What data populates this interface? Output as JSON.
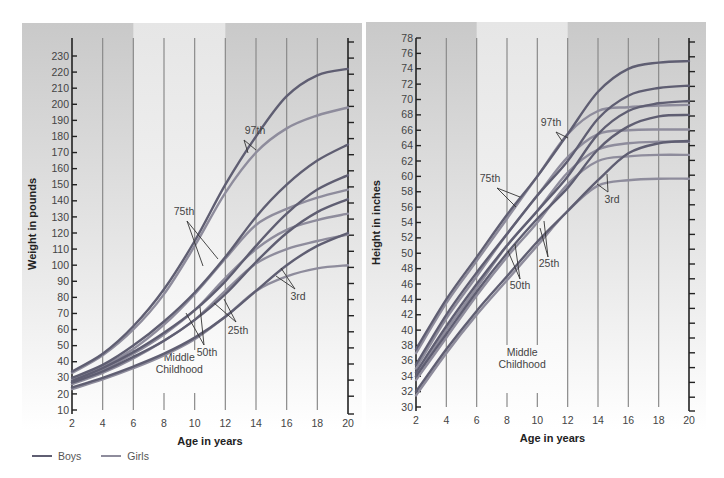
{
  "colors": {
    "boys": "#5f5e72",
    "girls": "#8e8c9c",
    "panel_dark": "#c9c9c9",
    "panel_light": "#e6e6e6",
    "grid": "#8a8a8a",
    "axis": "#222222"
  },
  "legend": {
    "boys_label": "Boys",
    "girls_label": "Girls"
  },
  "chart_data": [
    {
      "type": "line",
      "title": "",
      "xlabel": "Age in years",
      "ylabel": "Weight in pounds",
      "xlim": [
        2,
        20
      ],
      "ylim": [
        10,
        230
      ],
      "x_ticks": [
        2,
        4,
        6,
        8,
        10,
        12,
        14,
        16,
        18,
        20
      ],
      "y_ticks": [
        10,
        20,
        30,
        40,
        50,
        60,
        70,
        80,
        90,
        100,
        110,
        120,
        130,
        140,
        150,
        160,
        170,
        180,
        190,
        200,
        210,
        220,
        230
      ],
      "grid": true,
      "shaded_band": {
        "from": 6,
        "to": 12,
        "label": "Middle Childhood"
      },
      "annotations": [
        "97th",
        "75th",
        "50th",
        "25th",
        "3rd",
        "Middle Childhood"
      ],
      "legend": [
        "Boys",
        "Girls"
      ],
      "legend_position": "bottom-left",
      "x": [
        2,
        4,
        6,
        8,
        10,
        12,
        14,
        16,
        18,
        20
      ],
      "series": [
        {
          "name": "Boys 97th",
          "group": "Boys",
          "values": [
            34,
            45,
            62,
            85,
            115,
            150,
            180,
            205,
            218,
            222
          ]
        },
        {
          "name": "Girls 97th",
          "group": "Girls",
          "values": [
            33,
            44,
            60,
            82,
            112,
            145,
            170,
            185,
            193,
            198
          ]
        },
        {
          "name": "Boys 75th",
          "group": "Boys",
          "values": [
            30,
            38,
            50,
            65,
            83,
            105,
            130,
            150,
            165,
            175
          ]
        },
        {
          "name": "Girls 75th",
          "group": "Girls",
          "values": [
            29,
            37,
            48,
            63,
            82,
            104,
            125,
            135,
            142,
            147
          ]
        },
        {
          "name": "Boys 50th",
          "group": "Boys",
          "values": [
            28,
            36,
            46,
            58,
            72,
            90,
            112,
            132,
            147,
            156
          ]
        },
        {
          "name": "Girls 50th",
          "group": "Girls",
          "values": [
            27,
            35,
            45,
            57,
            72,
            92,
            110,
            122,
            128,
            132
          ]
        },
        {
          "name": "Boys 25th",
          "group": "Boys",
          "values": [
            27,
            34,
            43,
            53,
            66,
            82,
            102,
            120,
            133,
            141
          ]
        },
        {
          "name": "Girls 25th",
          "group": "Girls",
          "values": [
            26,
            33,
            42,
            53,
            66,
            84,
            101,
            110,
            115,
            119
          ]
        },
        {
          "name": "Boys 3rd",
          "group": "Boys",
          "values": [
            24,
            30,
            37,
            45,
            55,
            68,
            84,
            100,
            112,
            120
          ]
        },
        {
          "name": "Girls 3rd",
          "group": "Girls",
          "values": [
            23,
            29,
            36,
            44,
            54,
            68,
            84,
            93,
            98,
            100
          ]
        }
      ]
    },
    {
      "type": "line",
      "title": "",
      "xlabel": "Age in years",
      "ylabel": "Height in inches",
      "xlim": [
        2,
        20
      ],
      "ylim": [
        30,
        78
      ],
      "x_ticks": [
        2,
        4,
        6,
        8,
        10,
        12,
        14,
        16,
        18,
        20
      ],
      "y_ticks": [
        30,
        32,
        34,
        36,
        38,
        40,
        42,
        44,
        46,
        48,
        50,
        52,
        54,
        56,
        58,
        60,
        62,
        64,
        66,
        68,
        70,
        72,
        74,
        76,
        78
      ],
      "grid": true,
      "shaded_band": {
        "from": 6,
        "to": 12,
        "label": "Middle Childhood"
      },
      "annotations": [
        "97th",
        "75th",
        "50th",
        "25th",
        "3rd",
        "Middle Childhood"
      ],
      "x": [
        2,
        4,
        6,
        8,
        10,
        12,
        14,
        16,
        18,
        20
      ],
      "series": [
        {
          "name": "Boys 97th",
          "group": "Boys",
          "values": [
            37.5,
            44,
            49.5,
            55,
            60,
            65.5,
            71,
            74,
            74.8,
            75
          ]
        },
        {
          "name": "Girls 97th",
          "group": "Girls",
          "values": [
            37,
            43.5,
            49,
            54.5,
            60,
            65.5,
            68.5,
            69,
            69.2,
            69.3
          ]
        },
        {
          "name": "Boys 75th",
          "group": "Boys",
          "values": [
            35.5,
            42,
            47.5,
            52.5,
            57.5,
            62,
            67.5,
            70.5,
            71.5,
            71.8
          ]
        },
        {
          "name": "Girls 75th",
          "group": "Girls",
          "values": [
            35,
            41.5,
            47,
            52.5,
            57.5,
            62.5,
            65.5,
            66,
            66.1,
            66.1
          ]
        },
        {
          "name": "Boys 50th",
          "group": "Boys",
          "values": [
            34.5,
            40.5,
            46,
            51,
            55.5,
            60,
            65.5,
            68.5,
            69.5,
            69.8
          ]
        },
        {
          "name": "Girls 50th",
          "group": "Girls",
          "values": [
            34,
            40,
            45.5,
            51,
            55.5,
            60.5,
            63.5,
            64.3,
            64.5,
            64.5
          ]
        },
        {
          "name": "Boys 25th",
          "group": "Boys",
          "values": [
            34,
            39.5,
            45,
            50,
            54.5,
            58.5,
            63.5,
            66.5,
            67.8,
            68
          ]
        },
        {
          "name": "Girls 25th",
          "group": "Girls",
          "values": [
            33.5,
            39,
            44.5,
            49.5,
            54,
            59,
            62,
            62.6,
            62.8,
            62.8
          ]
        },
        {
          "name": "Boys 3rd",
          "group": "Boys",
          "values": [
            32,
            37.5,
            42.5,
            47,
            51.5,
            55.5,
            59.5,
            63,
            64.3,
            64.6
          ]
        },
        {
          "name": "Girls 3rd",
          "group": "Girls",
          "values": [
            31.5,
            37,
            42,
            46.5,
            51,
            55.5,
            58.8,
            59.5,
            59.7,
            59.7
          ]
        }
      ]
    }
  ]
}
